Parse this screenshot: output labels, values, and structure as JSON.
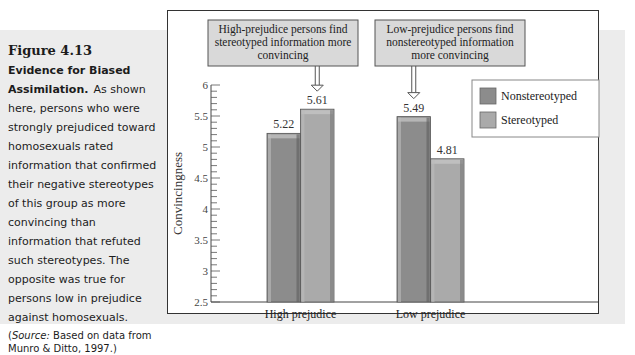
{
  "caption": {
    "figure_number": "Figure 4.13",
    "title": "Evidence for Biased Assimilation.",
    "body": "As shown here, persons who were strongly prejudiced toward homosexuals rated information that confirmed their negative stereotypes of this group as more convincing than information that refuted such stereotypes. The opposite was true for persons low in prejudice against homosexuals.",
    "source_label": "Source:",
    "source_text": "Based on data from Munro & Ditto, 1997.",
    "source_open": "(",
    "source_close": ")"
  },
  "colors": {
    "nonstereotyped": "#8c8c8c",
    "stereotyped": "#aaaaaa",
    "callout_fill": "#d9d9d9",
    "band": "#ececec"
  },
  "chart_data": {
    "type": "bar",
    "title": "",
    "xlabel": "",
    "ylabel": "Convincingness",
    "categories": [
      "High prejudice",
      "Low prejudice"
    ],
    "series": [
      {
        "name": "Nonstereotyped",
        "values": [
          5.22,
          5.49
        ]
      },
      {
        "name": "Stereotyped",
        "values": [
          5.61,
          4.81
        ]
      }
    ],
    "data_labels": [
      [
        "5.22",
        "5.49"
      ],
      [
        "5.61",
        "4.81"
      ]
    ],
    "ylim": [
      2.5,
      6
    ],
    "yticks": [
      "2.5",
      "3",
      "3.5",
      "4",
      "4.5",
      "5",
      "5.5",
      "6"
    ],
    "minor_tick_step": 0.1,
    "legend_position": "top-right",
    "grid": false,
    "annotations": [
      {
        "text_lines": [
          "High-prejudice persons find",
          "stereotyped information more",
          "convincing"
        ],
        "points_to": "High prejudice / Stereotyped"
      },
      {
        "text_lines": [
          "Low-prejudice persons find",
          "nonstereotyped information",
          "more convincing"
        ],
        "points_to": "Low prejudice / Nonstereotyped"
      }
    ]
  }
}
